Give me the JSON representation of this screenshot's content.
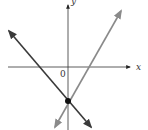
{
  "diagram": {
    "type": "coordinate-plane-two-lines",
    "axes": {
      "x_label": "x",
      "y_label": "y",
      "origin_label": "0"
    },
    "lines": [
      {
        "name": "decreasing-line",
        "color": "#3a3a3a",
        "slope": "negative"
      },
      {
        "name": "increasing-line",
        "color": "#8a8a8a",
        "slope": "positive"
      }
    ],
    "intersection": {
      "location": "on negative y-axis",
      "marker": "filled-dot",
      "color": "#111111"
    }
  }
}
